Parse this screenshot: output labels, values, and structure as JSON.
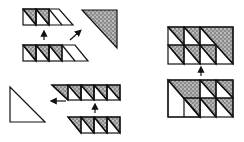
{
  "diagram": {
    "title": "",
    "colors": {
      "stroke": "#111111",
      "shade": "#8c8c8c",
      "background": "#ffffff"
    },
    "left_panel": {
      "strips": [
        {
          "id": "strip-a",
          "squares": 2,
          "has_tail": true
        },
        {
          "id": "strip-b",
          "squares": 3,
          "has_tail": true
        },
        {
          "id": "strip-c",
          "squares": 4,
          "has_tail": false,
          "has_head": true
        },
        {
          "id": "strip-d",
          "squares": 3,
          "has_tail": false,
          "has_head": true
        }
      ],
      "large_triangles": [
        {
          "id": "shaded-triangle",
          "shaded": true
        },
        {
          "id": "plain-triangle",
          "shaded": false
        }
      ],
      "arrows": [
        {
          "id": "arrow-b-to-a",
          "direction": "up"
        },
        {
          "id": "arrow-to-shaded-triangle",
          "direction": "up-right"
        },
        {
          "id": "arrow-d-to-c",
          "direction": "up"
        },
        {
          "id": "arrow-to-plain-triangle",
          "direction": "left"
        }
      ]
    },
    "right_panel": {
      "blocks": [
        {
          "id": "top-block",
          "rows": 2,
          "columns": 4,
          "note": "upper-right large shaded triangle occupying 2x2 area"
        },
        {
          "id": "bottom-block",
          "rows": 2,
          "columns": 4,
          "note": "lower-left large plain triangle occupying 2x2 area"
        }
      ],
      "arrows": [
        {
          "id": "arrow-bottom-to-top",
          "direction": "up"
        }
      ]
    }
  }
}
